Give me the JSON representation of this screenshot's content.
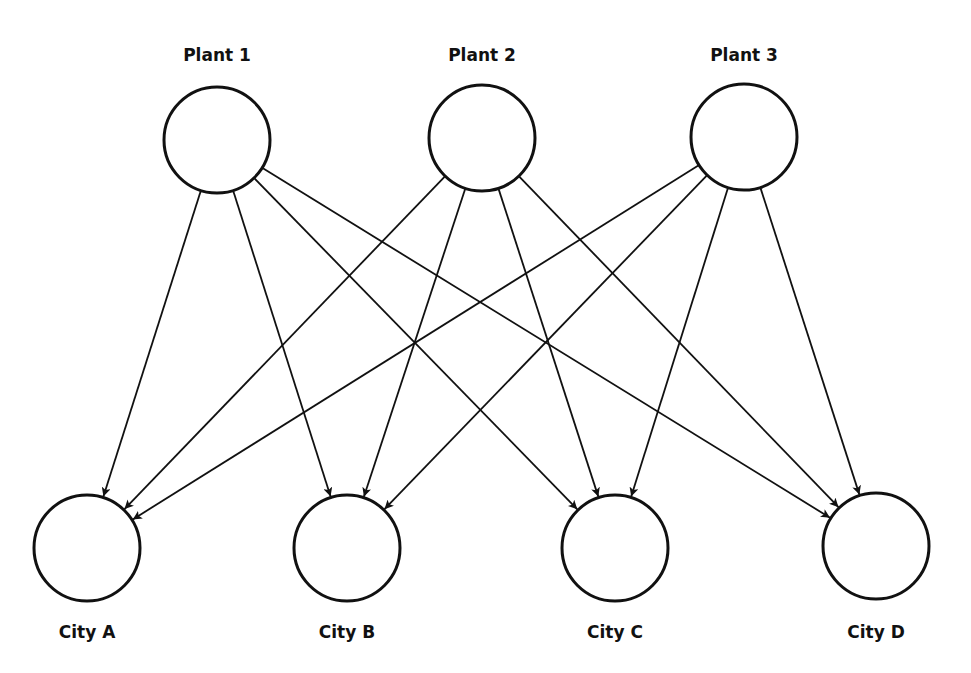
{
  "diagram": {
    "type": "bipartite-network",
    "sources": [
      {
        "id": "p1",
        "label": "Plant 1",
        "cx": 217,
        "cy": 140
      },
      {
        "id": "p2",
        "label": "Plant 2",
        "cx": 482,
        "cy": 138
      },
      {
        "id": "p3",
        "label": "Plant 3",
        "cx": 744,
        "cy": 137
      }
    ],
    "destinations": [
      {
        "id": "a",
        "label": "City A",
        "cx": 87,
        "cy": 548
      },
      {
        "id": "b",
        "label": "City B",
        "cx": 347,
        "cy": 548
      },
      {
        "id": "c",
        "label": "City C",
        "cx": 615,
        "cy": 548
      },
      {
        "id": "d",
        "label": "City D",
        "cx": 876,
        "cy": 546
      }
    ],
    "edges": [
      [
        "p1",
        "a"
      ],
      [
        "p1",
        "b"
      ],
      [
        "p1",
        "c"
      ],
      [
        "p1",
        "d"
      ],
      [
        "p2",
        "a"
      ],
      [
        "p2",
        "b"
      ],
      [
        "p2",
        "c"
      ],
      [
        "p2",
        "d"
      ],
      [
        "p3",
        "a"
      ],
      [
        "p3",
        "b"
      ],
      [
        "p3",
        "c"
      ],
      [
        "p3",
        "d"
      ]
    ],
    "node_radius": 53,
    "colors": {
      "stroke": "#111111",
      "fill": "#ffffff"
    }
  }
}
